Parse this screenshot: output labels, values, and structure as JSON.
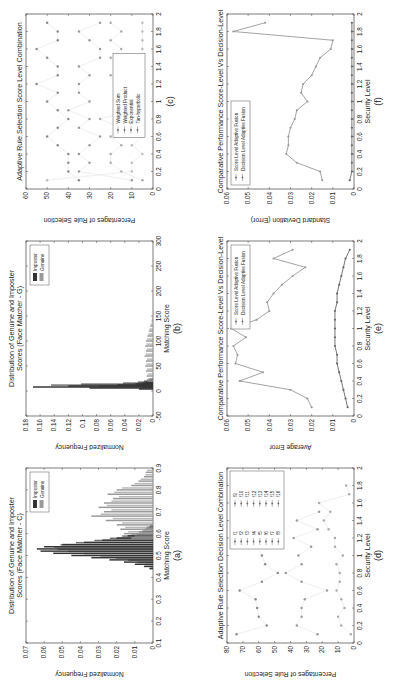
{
  "figure": {
    "orientation": "rotated-90-ccw",
    "panels_layout": [
      [
        "a",
        "b",
        "c"
      ],
      [
        "d",
        "e",
        "f"
      ]
    ]
  },
  "chart_data": [
    {
      "id": "a",
      "caption": "(a)",
      "type": "bar",
      "title": "Distribution of Genuine and Imposter Scores (Face Matcher - C)",
      "xlabel": "Matching Score",
      "ylabel": "Normalized Frequency",
      "xlim": [
        0.1,
        0.9
      ],
      "ylim": [
        0,
        0.07
      ],
      "xticks": [
        "0.1",
        "0.2",
        "0.3",
        "0.4",
        "0.5",
        "0.6",
        "0.7",
        "0.8",
        "0.9"
      ],
      "yticks": [
        "0",
        "0.01",
        "0.02",
        "0.03",
        "0.04",
        "0.05",
        "0.06",
        "0.07"
      ],
      "legend": [
        "Imposter",
        "Genuine"
      ],
      "legend_position": "upper right",
      "series": [
        {
          "name": "Imposter",
          "color": "#333333",
          "x": [
            0.44,
            0.45,
            0.46,
            0.47,
            0.48,
            0.49,
            0.5,
            0.51,
            0.52,
            0.53,
            0.54,
            0.55,
            0.56,
            0.57,
            0.58,
            0.59,
            0.6,
            0.61,
            0.62,
            0.63
          ],
          "values": [
            0.002,
            0.005,
            0.01,
            0.016,
            0.024,
            0.034,
            0.045,
            0.055,
            0.062,
            0.064,
            0.06,
            0.05,
            0.038,
            0.028,
            0.02,
            0.014,
            0.009,
            0.006,
            0.004,
            0.002
          ]
        },
        {
          "name": "Genuine",
          "color": "#999999",
          "x": [
            0.58,
            0.6,
            0.62,
            0.64,
            0.66,
            0.68,
            0.7,
            0.72,
            0.74,
            0.76,
            0.78,
            0.8,
            0.82,
            0.84,
            0.86,
            0.88
          ],
          "values": [
            0.012,
            0.016,
            0.018,
            0.02,
            0.026,
            0.034,
            0.027,
            0.03,
            0.027,
            0.022,
            0.025,
            0.02,
            0.012,
            0.008,
            0.005,
            0.004
          ]
        }
      ]
    },
    {
      "id": "b",
      "caption": "(b)",
      "type": "bar",
      "title": "Distribution of Genuine and Imposter Scores (Face Matcher - G)",
      "xlabel": "Matching Score",
      "ylabel": "Normalized Frequency",
      "xlim": [
        -50,
        300
      ],
      "ylim": [
        0,
        0.18
      ],
      "xticks": [
        "-50",
        "0",
        "50",
        "100",
        "150",
        "200",
        "250",
        "300"
      ],
      "yticks": [
        "0",
        "0.02",
        "0.04",
        "0.06",
        "0.08",
        "0.1",
        "0.12",
        "0.14",
        "0.16",
        "0.18"
      ],
      "legend": [
        "Imposter",
        "Genuine"
      ],
      "legend_position": "upper right",
      "series": [
        {
          "name": "Imposter",
          "color": "#333333",
          "x": [
            4,
            6,
            8,
            10,
            12,
            14,
            16,
            18,
            20
          ],
          "values": [
            0.02,
            0.09,
            0.17,
            0.12,
            0.05,
            0.025,
            0.015,
            0.01,
            0.006
          ]
        },
        {
          "name": "Genuine",
          "color": "#999999",
          "x": [
            20,
            30,
            40,
            50,
            60,
            70,
            80,
            90,
            100,
            110,
            120,
            130,
            140
          ],
          "values": [
            0.008,
            0.009,
            0.01,
            0.011,
            0.01,
            0.012,
            0.01,
            0.011,
            0.01,
            0.008,
            0.006,
            0.004,
            0.002
          ]
        }
      ]
    },
    {
      "id": "c",
      "caption": "(c)",
      "type": "scatter",
      "title": "Adaptive Rule Selection Score Level Combination",
      "xlabel": "",
      "ylabel": "Percentages of Rule Selection",
      "xlim": [
        0,
        2
      ],
      "ylim": [
        0,
        60
      ],
      "xticks": [
        "0",
        "0.2",
        "0.4",
        "0.6",
        "0.8",
        "1",
        "1.2",
        "1.4",
        "1.6",
        "1.8",
        "2"
      ],
      "yticks": [
        "0",
        "10",
        "20",
        "30",
        "40",
        "50",
        "60"
      ],
      "legend": [
        "Weighted Sum",
        "Weighted Product",
        "Exponential",
        "Tan-hyperbolic"
      ],
      "legend_position": "lower center",
      "series": [
        {
          "name": "Weighted Sum",
          "color": "#888888",
          "x": [
            0.1,
            0.2,
            0.3,
            0.4,
            0.5,
            0.6,
            0.7,
            0.8,
            0.9,
            1.0,
            1.1,
            1.2,
            1.3,
            1.4,
            1.5,
            1.6,
            1.7,
            1.8,
            1.9
          ],
          "values": [
            35,
            40,
            40,
            40,
            45,
            50,
            45,
            40,
            45,
            50,
            45,
            55,
            45,
            45,
            50,
            55,
            45,
            45,
            50
          ]
        },
        {
          "name": "Weighted Product",
          "color": "#999999",
          "x": [
            0.1,
            0.2,
            0.3,
            0.4,
            0.5,
            0.6,
            0.7,
            0.8,
            0.9,
            1.0,
            1.1,
            1.2,
            1.3,
            1.4,
            1.5,
            1.6,
            1.7,
            1.8,
            1.9
          ],
          "values": [
            10,
            35,
            30,
            35,
            30,
            25,
            35,
            30,
            40,
            30,
            35,
            35,
            30,
            35,
            25,
            25,
            30,
            35,
            25
          ]
        },
        {
          "name": "Exponential",
          "color": "#aaaaaa",
          "x": [
            0.1,
            0.2,
            0.3,
            0.4,
            0.5,
            0.6,
            0.7,
            0.8,
            0.9,
            1.0,
            1.1,
            1.2,
            1.3,
            1.4,
            1.5,
            1.6,
            1.7,
            1.8,
            1.9
          ],
          "values": [
            5,
            15,
            20,
            20,
            15,
            20,
            15,
            25,
            10,
            15,
            15,
            5,
            20,
            15,
            20,
            15,
            20,
            15,
            20
          ]
        },
        {
          "name": "Tan-hyperbolic",
          "color": "#bbbbbb",
          "x": [
            0.1,
            0.2,
            0.3,
            0.4,
            0.5,
            0.6,
            0.7,
            0.8,
            0.9,
            1.0,
            1.1,
            1.2,
            1.3,
            1.4,
            1.5,
            1.6,
            1.7,
            1.8,
            1.9
          ],
          "values": [
            50,
            10,
            10,
            5,
            10,
            5,
            5,
            5,
            5,
            5,
            5,
            5,
            5,
            5,
            5,
            5,
            5,
            5,
            5
          ]
        }
      ]
    },
    {
      "id": "d",
      "caption": "(d)",
      "type": "scatter",
      "title": "Adaptive Rule Selection Decision Level Combination",
      "xlabel": "Security Level",
      "ylabel": "Percentages of Rule Selection",
      "xlim": [
        0,
        2
      ],
      "ylim": [
        0,
        80
      ],
      "xticks": [
        "0",
        "0.2",
        "0.4",
        "0.6",
        "0.8",
        "1",
        "1.2",
        "1.4",
        "1.6",
        "1.8",
        "2"
      ],
      "yticks": [
        "0",
        "10",
        "20",
        "30",
        "40",
        "50",
        "60",
        "70",
        "80"
      ],
      "legend": [
        "f1",
        "f2",
        "f3",
        "f4",
        "f5",
        "f6",
        "f7",
        "f8",
        "f9",
        "f10",
        "f11",
        "f12",
        "f13",
        "f14",
        "f15",
        "f16"
      ],
      "legend_position": "upper right",
      "series": [
        {
          "name": "f1",
          "color": "#888888",
          "x": [
            0.1,
            0.2,
            0.3,
            0.4,
            0.5,
            0.6,
            0.7,
            0.8,
            0.9,
            1.0,
            1.1,
            1.2,
            1.3,
            1.4,
            1.5
          ],
          "values": [
            74,
            55,
            60,
            61,
            62,
            72,
            58,
            48,
            56,
            58,
            61,
            50,
            60,
            45,
            65
          ]
        },
        {
          "name": "f2",
          "color": "#999999",
          "x": [
            0.1,
            0.2,
            0.3,
            0.4,
            0.5,
            0.6,
            0.7,
            0.8,
            0.9,
            1.0,
            1.1,
            1.2,
            1.3,
            1.4,
            1.5
          ],
          "values": [
            23,
            36,
            33,
            33,
            31,
            17,
            33,
            43,
            33,
            35,
            27,
            38,
            23,
            36,
            22
          ]
        },
        {
          "name": "f3",
          "color": "#aaaaaa",
          "x": [
            0.1,
            0.2,
            0.3,
            0.4,
            0.5,
            0.6,
            0.7,
            0.8,
            0.9,
            1.0,
            1.1,
            1.2,
            1.3,
            1.4,
            1.5,
            1.6,
            1.7,
            1.8
          ],
          "values": [
            2,
            8,
            10,
            6,
            8,
            11,
            9,
            9,
            11,
            7,
            12,
            12,
            16,
            19,
            15,
            22,
            3,
            5
          ]
        }
      ]
    },
    {
      "id": "e",
      "caption": "(e)",
      "type": "line",
      "title": "Comparative Performance Score-Level Vs Decision-Level",
      "xlabel": "Security Level",
      "ylabel": "Average Error",
      "xlim": [
        0,
        2
      ],
      "ylim": [
        0,
        0.06
      ],
      "xticks": [
        "0",
        "0.2",
        "0.4",
        "0.6",
        "0.8",
        "1",
        "1.2",
        "1.4",
        "1.6",
        "1.8",
        "2"
      ],
      "yticks": [
        "0",
        "0.01",
        "0.02",
        "0.03",
        "0.04",
        "0.05",
        "0.06"
      ],
      "legend": [
        "Score Level Adaptive Fusion",
        "Decision Level Adaptive Fusion"
      ],
      "legend_position": "upper right",
      "x": [
        0.1,
        0.2,
        0.3,
        0.4,
        0.5,
        0.6,
        0.7,
        0.8,
        0.9,
        1.0,
        1.1,
        1.2,
        1.3,
        1.4,
        1.5,
        1.6,
        1.7,
        1.8,
        1.9
      ],
      "series": [
        {
          "name": "Score Level Adaptive Fusion",
          "color": "#999999",
          "values": [
            0.02,
            0.022,
            0.03,
            0.054,
            0.043,
            0.056,
            0.055,
            0.057,
            0.051,
            0.058,
            0.046,
            0.04,
            0.041,
            0.038,
            0.034,
            0.029,
            0.023,
            0.038,
            0.029
          ]
        },
        {
          "name": "Decision Level Adaptive Fusion",
          "color": "#666666",
          "values": [
            0.003,
            0.004,
            0.005,
            0.006,
            0.007,
            0.008,
            0.008,
            0.009,
            0.009,
            0.009,
            0.009,
            0.009,
            0.008,
            0.008,
            0.007,
            0.006,
            0.005,
            0.004,
            0.002
          ]
        }
      ]
    },
    {
      "id": "f",
      "caption": "(f)",
      "type": "line",
      "title": "Comparative Performance Score-Level Vs Decision-Level",
      "xlabel": "Security Level",
      "ylabel": "Standard Deviation (Error)",
      "xlim": [
        0,
        2
      ],
      "ylim": [
        0,
        0.06
      ],
      "xticks": [
        "0",
        "0.2",
        "0.4",
        "0.6",
        "0.8",
        "1",
        "1.2",
        "1.4",
        "1.6",
        "1.8",
        "2"
      ],
      "yticks": [
        "0",
        "0.01",
        "0.02",
        "0.03",
        "0.04",
        "0.05",
        "0.06"
      ],
      "legend": [
        "Score Level Adaptive Fusion",
        "Decision Level Adaptive Fusion"
      ],
      "legend_position": "upper left",
      "x": [
        0.1,
        0.2,
        0.3,
        0.4,
        0.5,
        0.6,
        0.7,
        0.8,
        0.9,
        1.0,
        1.1,
        1.2,
        1.3,
        1.4,
        1.5,
        1.6,
        1.7,
        1.8,
        1.9
      ],
      "series": [
        {
          "name": "Score Level Adaptive Fusion",
          "color": "#999999",
          "values": [
            0.015,
            0.016,
            0.027,
            0.032,
            0.031,
            0.031,
            0.03,
            0.028,
            0.027,
            0.022,
            0.025,
            0.024,
            0.02,
            0.018,
            0.016,
            0.011,
            0.01,
            0.057,
            0.042
          ]
        },
        {
          "name": "Decision Level Adaptive Fusion",
          "color": "#666666",
          "values": [
            0.002,
            0.001,
            0.001,
            0.001,
            0.001,
            0.001,
            0.001,
            0.001,
            0.001,
            0.001,
            0.001,
            0.001,
            0.001,
            0.001,
            0.001,
            0.001,
            0.001,
            0.001,
            0.001
          ]
        }
      ]
    }
  ]
}
